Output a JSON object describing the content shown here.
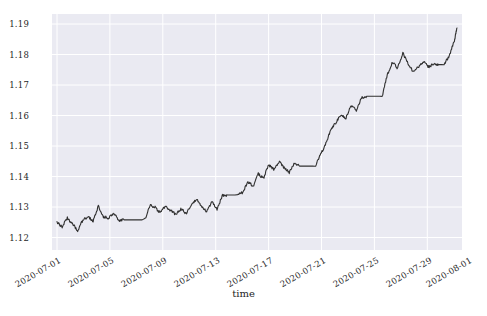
{
  "chart_data": {
    "type": "line",
    "title": "",
    "xlabel": "time",
    "ylabel": "",
    "ylim": [
      1.1155,
      1.1915
    ],
    "xlim": [
      "2020-07-01",
      "2020-08-01"
    ],
    "grid": true,
    "legend": null,
    "style": "seaborn-darkgrid",
    "line_color": "#303030",
    "plot_bg": "#eaeaf2",
    "grid_color": "#ffffff",
    "yticks": [
      "1.19",
      "1.18",
      "1.17",
      "1.16",
      "1.15",
      "1.14",
      "1.13",
      "1.12"
    ],
    "ytick_values": [
      1.19,
      1.18,
      1.17,
      1.16,
      1.15,
      1.14,
      1.13,
      1.12
    ],
    "xticks": [
      "2020-07-01",
      "2020-07-05",
      "2020-07-09",
      "2020-07-13",
      "2020-07-17",
      "2020-07-21",
      "2020-07-25",
      "2020-07-29",
      "2020-08-01"
    ],
    "series": [
      {
        "name": "rate",
        "x": [
          0.0,
          0.4,
          0.8,
          1.2,
          1.6,
          2.0,
          2.4,
          2.8,
          3.2,
          3.6,
          4.0,
          4.4,
          4.8,
          5.2,
          5.6,
          6.0,
          6.4,
          6.8,
          7.2,
          7.6,
          8.0,
          8.4,
          8.8,
          9.2,
          9.6,
          10.0,
          10.4,
          10.8,
          11.2,
          11.6,
          12.0,
          12.4,
          12.8,
          13.2,
          13.6,
          14.0,
          14.4,
          14.8,
          15.2,
          15.6,
          16.0,
          16.4,
          16.8,
          17.2,
          17.6,
          18.0,
          18.4,
          18.8,
          19.2,
          19.6,
          20.0,
          20.4,
          20.8,
          21.2,
          21.6,
          22.0,
          22.4,
          22.8,
          23.2,
          23.6,
          24.0,
          24.4,
          24.8,
          25.2,
          25.6,
          26.0,
          26.4,
          26.8,
          27.2,
          27.6,
          28.0,
          28.4,
          28.8,
          29.2,
          29.6,
          30.0,
          30.4,
          30.8,
          31.0
        ],
        "values": [
          1.1245,
          1.123,
          1.1258,
          1.124,
          1.1215,
          1.1252,
          1.1262,
          1.1248,
          1.1295,
          1.1262,
          1.1258,
          1.1272,
          1.125,
          1.1252,
          1.1252,
          1.1252,
          1.1252,
          1.1252,
          1.13,
          1.1292,
          1.1275,
          1.1296,
          1.1282,
          1.127,
          1.1288,
          1.1272,
          1.13,
          1.132,
          1.1295,
          1.1278,
          1.131,
          1.1285,
          1.133,
          1.1332,
          1.1332,
          1.1332,
          1.134,
          1.1375,
          1.136,
          1.14,
          1.1385,
          1.143,
          1.1415,
          1.144,
          1.142,
          1.1405,
          1.1435,
          1.1425,
          1.1425,
          1.1425,
          1.1425,
          1.146,
          1.1495,
          1.154,
          1.1565,
          1.159,
          1.158,
          1.162,
          1.1605,
          1.1645,
          1.165,
          1.165,
          1.165,
          1.165,
          1.172,
          1.176,
          1.174,
          1.179,
          1.1755,
          1.173,
          1.1745,
          1.176,
          1.1745,
          1.1755,
          1.1752,
          1.1752,
          1.178,
          1.183,
          1.187
        ]
      }
    ],
    "annotations": []
  },
  "axis": {
    "x_label": "time"
  }
}
